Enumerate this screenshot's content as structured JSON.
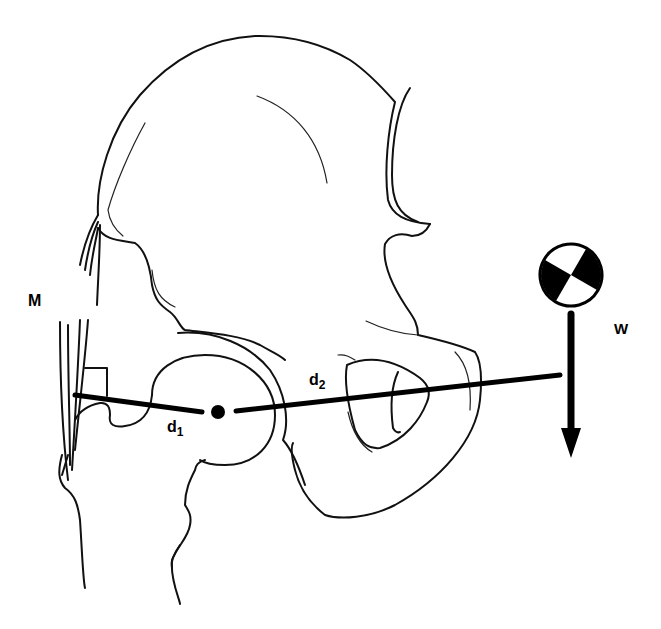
{
  "figure": {
    "labels": {
      "muscle": "M",
      "weight": "W",
      "d1_base": "d",
      "d1_sub": "1",
      "d2_base": "d",
      "d2_sub": "2"
    },
    "elements": {
      "fulcrum": "femoral head center (pivot dot)",
      "center_of_mass_symbol": "quartered circle",
      "weight_arrow_direction": "down",
      "right_angle_marker": "at abductor muscle insertion"
    },
    "colors": {
      "ink": "#111111",
      "background": "#ffffff"
    }
  }
}
